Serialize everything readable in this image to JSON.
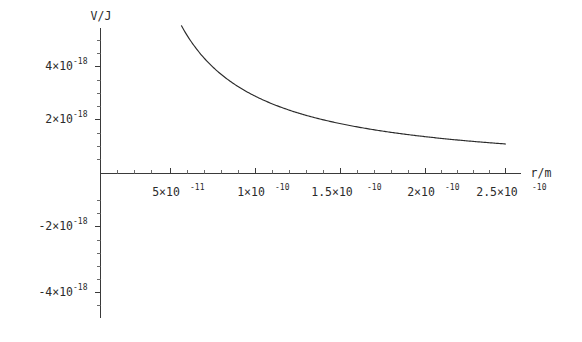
{
  "chart_data": {
    "type": "line",
    "title": "",
    "subtitle": "",
    "xlabel": "r/m",
    "ylabel": "V/J",
    "xlim": [
      0.0,
      2.75e-10
    ],
    "ylim": [
      -5e-18,
      5.6e-18
    ],
    "grid": false,
    "legend": null,
    "x_ticks": [
      {
        "value": 5e-11,
        "label": "5×10",
        "exponent": "-11"
      },
      {
        "value": 1e-10,
        "label": "1×10",
        "exponent": "-10"
      },
      {
        "value": 1.5e-10,
        "label": "1.5×10",
        "exponent": "-10"
      },
      {
        "value": 2e-10,
        "label": "2×10",
        "exponent": "-10"
      },
      {
        "value": 2.5e-10,
        "label": "2.5×10",
        "exponent": "-10"
      }
    ],
    "y_ticks": [
      {
        "value": 4e-18,
        "label": "4×10",
        "exponent": "-18"
      },
      {
        "value": 2e-18,
        "label": "2×10",
        "exponent": "-18"
      },
      {
        "value": -2e-18,
        "label": "-2×10",
        "exponent": "-18"
      },
      {
        "value": -4e-18,
        "label": "-4×10",
        "exponent": "-18"
      }
    ],
    "series": [
      {
        "name": "V(r) = k e² / r",
        "color": "#2b2b2b",
        "x": [
          5e-11,
          5.5e-11,
          6e-11,
          6.5e-11,
          7e-11,
          7.5e-11,
          8e-11,
          8.5e-11,
          9e-11,
          9.5e-11,
          1e-10,
          1.1e-10,
          1.2e-10,
          1.3e-10,
          1.4e-10,
          1.5e-10,
          1.6e-10,
          1.7e-10,
          1.8e-10,
          1.9e-10,
          2e-10,
          2.1e-10,
          2.2e-10,
          2.3e-10,
          2.4e-10,
          2.5e-10
        ],
        "y": [
          5.52e-18,
          5.02e-18,
          4.6e-18,
          4.25e-18,
          3.94e-18,
          3.68e-18,
          3.45e-18,
          3.25e-18,
          3.07e-18,
          2.91e-18,
          2.76e-18,
          2.51e-18,
          2.3e-18,
          2.12e-18,
          1.97e-18,
          1.84e-18,
          1.73e-18,
          1.62e-18,
          1.53e-18,
          1.45e-18,
          1.38e-18,
          1.31e-18,
          1.26e-18,
          1.2e-18,
          1.15e-18,
          1.1e-18
        ]
      }
    ]
  },
  "axes": {
    "y_axis_title": "V/J",
    "x_axis_title": "r/m"
  }
}
